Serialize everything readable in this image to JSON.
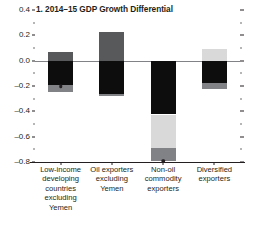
{
  "chart_data": {
    "type": "bar",
    "title": "1. 2014–15 GDP Growth Differential",
    "subtitle": "",
    "xlabel": "",
    "ylabel": "",
    "ylim": [
      -0.8,
      0.4
    ],
    "ytick_step": 0.2,
    "yticks": [
      "0.4",
      "0.2",
      "0.0",
      "-0.2",
      "-0.4",
      "-0.6",
      "-0.8"
    ],
    "ytick_values": [
      0.4,
      0.2,
      0.0,
      -0.2,
      -0.4,
      -0.6,
      -0.8
    ],
    "grid": false,
    "legend_position": "none",
    "zero_line": 0.0,
    "categories": [
      "Low-income\ndeveloping\ncountries\nexcluding\nYemen",
      "Oil exporters\nexcluding\nYemen",
      "Non-oil\ncommodity\nexporters",
      "Diversified\nexporters"
    ],
    "stacked": true,
    "series": [
      {
        "name": "upper-segment",
        "color": "#58595b",
        "values": [
          0.065,
          0.225,
          0.0,
          0.09
        ]
      },
      {
        "name": "middle-segment",
        "color": "#0d0d0d",
        "values": [
          -0.195,
          -0.265,
          -0.425,
          -0.175
        ]
      },
      {
        "name": "lower-segment",
        "color": "#d9d9d9",
        "values": [
          0.0,
          0.0,
          -0.265,
          0.0
        ]
      },
      {
        "name": "bottom-segment",
        "color": "#808285",
        "values": [
          -0.05,
          -0.015,
          -0.105,
          -0.045
        ]
      }
    ],
    "bars": [
      {
        "category": "Low-income developing countries excluding Yemen",
        "segments": [
          {
            "name": "upper-segment",
            "from": 0.0,
            "to": 0.065,
            "color": "#58595b"
          },
          {
            "name": "middle-segment",
            "from": 0.0,
            "to": -0.195,
            "color": "#0d0d0d"
          },
          {
            "name": "bottom-segment",
            "from": -0.195,
            "to": -0.245,
            "color": "#808285"
          }
        ],
        "total": -0.245,
        "marker": -0.2
      },
      {
        "category": "Oil exporters excluding Yemen",
        "segments": [
          {
            "name": "upper-segment",
            "from": 0.0,
            "to": 0.225,
            "color": "#58595b"
          },
          {
            "name": "middle-segment",
            "from": 0.0,
            "to": -0.265,
            "color": "#0d0d0d"
          },
          {
            "name": "bottom-segment",
            "from": -0.265,
            "to": -0.28,
            "color": "#808285"
          }
        ],
        "total": -0.28,
        "marker": null
      },
      {
        "category": "Non-oil commodity exporters",
        "segments": [
          {
            "name": "middle-segment",
            "from": 0.0,
            "to": -0.425,
            "color": "#0d0d0d"
          },
          {
            "name": "lower-segment",
            "from": -0.425,
            "to": -0.69,
            "color": "#d9d9d9"
          },
          {
            "name": "bottom-segment",
            "from": -0.69,
            "to": -0.795,
            "color": "#808285"
          }
        ],
        "total": -0.795,
        "marker": -0.79
      },
      {
        "category": "Diversified exporters",
        "segments": [
          {
            "name": "upper-segment",
            "from": 0.0,
            "to": 0.09,
            "color": "#d9d9d9"
          },
          {
            "name": "middle-segment",
            "from": 0.0,
            "to": -0.175,
            "color": "#0d0d0d"
          },
          {
            "name": "bottom-segment",
            "from": -0.175,
            "to": -0.22,
            "color": "#808285"
          }
        ],
        "total": -0.22,
        "marker": null
      }
    ],
    "colors": {
      "dark_gray": "#58595b",
      "black": "#0d0d0d",
      "light_gray": "#d9d9d9",
      "mid_gray": "#808285",
      "axis": "#231f20",
      "zero_line": "#808285"
    }
  }
}
